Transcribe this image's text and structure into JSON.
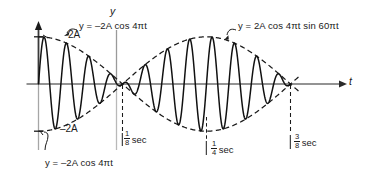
{
  "figure": {
    "kind": "beats-amplitude-modulation-waveform",
    "axes": {
      "y_axis_label": "y",
      "t_axis_label": "t",
      "y_tick_top_label": "2A",
      "y_tick_bottom_label": "–2A",
      "t_ticks": [
        {
          "num": "1",
          "den": "8",
          "unit": "sec"
        },
        {
          "num": "1",
          "den": "4",
          "unit": "sec"
        },
        {
          "num": "3",
          "den": "8",
          "unit": "sec"
        }
      ]
    },
    "annotations": {
      "upper_envelope": "y  =  –2A cos 4πt",
      "main_curve": "y  =  2A cos 4πt sin 60πt",
      "lower_envelope": "y  =  –2A cos 4πt"
    },
    "colors": {
      "ink": "#1a1a1a",
      "axis": "#6f6f6f",
      "curve": "#111111",
      "envelope": "#1a1a1a",
      "background": "#ffffff"
    }
  },
  "chart_data": {
    "type": "line",
    "title": "",
    "xlabel": "t",
    "ylabel": "y",
    "xlim": [
      0,
      0.375
    ],
    "ylim": [
      -2,
      2
    ],
    "grid": false,
    "legend": "inline-annotations",
    "x_ticks": [
      0.125,
      0.25,
      0.375
    ],
    "x_tick_labels": [
      "1/8 sec",
      "1/4 sec",
      "3/8 sec"
    ],
    "y_ticks": [
      -2,
      0,
      2
    ],
    "y_tick_labels": [
      "–2A",
      "0",
      "2A"
    ],
    "series": [
      {
        "name": "y = 2A cos 4πt sin 60πt",
        "style": "solid",
        "formula": "2*A*cos(4*pi*t)*sin(60*pi*t)",
        "amplitude_units_of_A": 2,
        "envelope_frequency_hz": 2,
        "carrier_frequency_hz": 30,
        "t_start": 0,
        "t_end": 0.375
      },
      {
        "name": "y = –2A cos 4πt (upper envelope)",
        "style": "dashed",
        "formula": "-2*A*cos(4*pi*t)",
        "t_start": 0,
        "t_end": 0.385
      },
      {
        "name": "y = –2A cos 4πt (lower envelope)",
        "style": "dashed",
        "formula": "2*A*cos(4*pi*t)",
        "t_start": 0,
        "t_end": 0.385
      }
    ],
    "nodes_at_t": [
      0.125,
      0.375
    ],
    "antinodes_at_t": [
      0,
      0.25
    ]
  }
}
